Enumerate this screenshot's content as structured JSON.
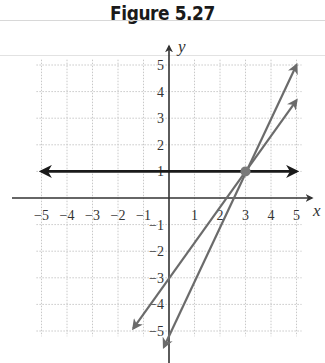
{
  "figure": {
    "title": "Figure 5.27"
  },
  "chart_data": {
    "type": "line",
    "title": "Figure 5.27",
    "xlabel": "x",
    "ylabel": "y",
    "xlim": [
      -5,
      5
    ],
    "ylim": [
      -5,
      5
    ],
    "grid": true,
    "x_ticks": [
      "−5",
      "−4",
      "−3",
      "−2",
      "−1",
      "1",
      "2",
      "3",
      "4",
      "5"
    ],
    "y_ticks": [
      "5",
      "4",
      "3",
      "2",
      "1",
      "−1",
      "−2",
      "−3",
      "−4",
      "−5"
    ],
    "series": [
      {
        "name": "y = 1",
        "equation": "y = 1",
        "color": "#1a1a1a",
        "points": [
          [
            -5,
            1
          ],
          [
            5,
            1
          ]
        ]
      },
      {
        "name": "y = (4/3)x − 3",
        "equation": "y = (4/3)x - 3",
        "color": "#6b6b6b",
        "points": [
          [
            -1.4,
            -4.9
          ],
          [
            5,
            3.67
          ]
        ]
      },
      {
        "name": "y = 2x − 5",
        "equation": "y = 2x - 5",
        "color": "#6b6b6b",
        "points": [
          [
            -0.2,
            -5.6
          ],
          [
            5,
            5
          ]
        ]
      }
    ],
    "annotations": [
      {
        "type": "intersection-point",
        "x": 3,
        "y": 1,
        "color": "#7a7a7a"
      }
    ]
  }
}
